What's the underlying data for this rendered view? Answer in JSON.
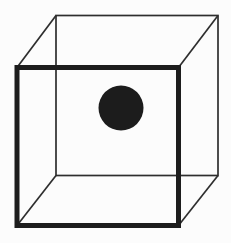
{
  "figure": {
    "background_color": "#fcfcfc",
    "canvas": {
      "width": 231,
      "height": 243
    },
    "back_face": {
      "type": "rect",
      "x": 56,
      "y": 15.5,
      "width": 162,
      "height": 160,
      "stroke": "#2e2e2e",
      "stroke_width": 1.7,
      "fill": "none"
    },
    "front_face": {
      "type": "rect",
      "x": 17,
      "y": 67.5,
      "width": 161.5,
      "height": 158,
      "stroke": "#1d1d1d",
      "stroke_width": 5,
      "fill": "none"
    },
    "connecting_edges": [
      {
        "x1": 17,
        "y1": 67.5,
        "x2": 56,
        "y2": 15.5
      },
      {
        "x1": 178.5,
        "y1": 67.5,
        "x2": 218,
        "y2": 15.5
      },
      {
        "x1": 17,
        "y1": 225.5,
        "x2": 56,
        "y2": 175.5
      },
      {
        "x1": 178.5,
        "y1": 225.5,
        "x2": 218,
        "y2": 175.5
      }
    ],
    "edge_style": {
      "stroke": "#2e2e2e",
      "stroke_width": 1.7
    },
    "dot": {
      "type": "circle",
      "cx": 121,
      "cy": 108,
      "r": 22.5,
      "fill": "#1c1c1c"
    }
  }
}
